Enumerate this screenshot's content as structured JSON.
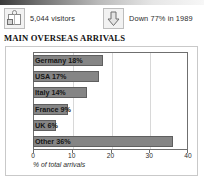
{
  "stats": [
    {
      "id": "visitors",
      "icon": "suitcase-icon",
      "text": "5,044 visitors"
    },
    {
      "id": "change",
      "icon": "down-arrow-icon",
      "text": "Down 77% in 1989"
    }
  ],
  "title": "MAIN OVERSEAS ARRIVALS",
  "colors": {
    "bar_fill": "#858585",
    "bar_stroke": "#5f5f5f",
    "axis": "#6f6f6f",
    "grid": "#d8d8d8",
    "frame": "#c9c9c9"
  },
  "chart_data": {
    "type": "bar",
    "orientation": "horizontal",
    "title": "MAIN OVERSEAS ARRIVALS",
    "xlabel": "% of total arrivals",
    "ylabel": "",
    "xlim": [
      0,
      40
    ],
    "xticks": [
      0,
      10,
      20,
      30,
      40
    ],
    "grid": true,
    "legend": "none",
    "categories": [
      "Germany",
      "USA",
      "Italy",
      "France",
      "UK",
      "Other"
    ],
    "values": [
      18,
      17,
      14,
      9,
      6,
      36
    ],
    "bar_labels": [
      "Germany 18%",
      "USA 17%",
      "Italy 14%",
      "France 9%",
      "UK 6%",
      "Other 36%"
    ]
  }
}
